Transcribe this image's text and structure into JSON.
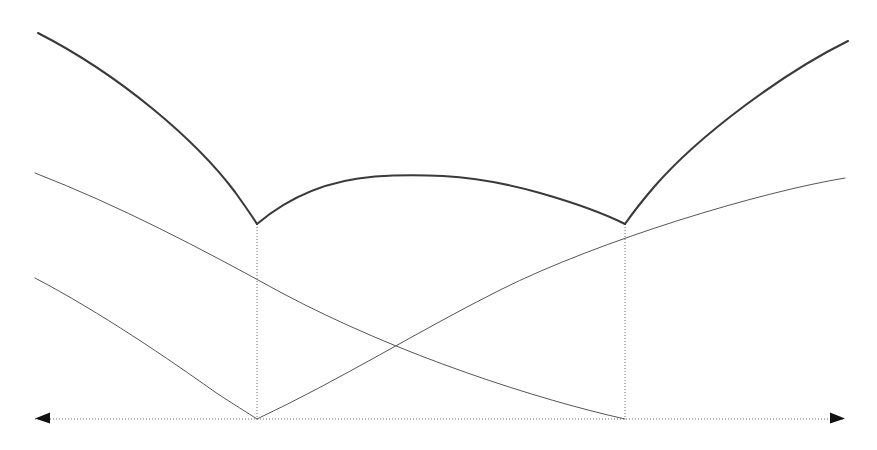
{
  "figure": {
    "type": "geometric-diagram",
    "width": 877,
    "height": 450,
    "background_color": "#ffffff"
  },
  "style": {
    "thick_stroke_color": "#3a3a3a",
    "thick_stroke_width": 2.1,
    "thin_stroke_color": "#555555",
    "thin_stroke_width": 1.0,
    "dotted_stroke_color": "#6f6f6f",
    "dotted_stroke_width": 1.0,
    "dotted_dash_pattern": "1,2",
    "arrowhead_fill": "#111111"
  },
  "geometry": {
    "baseline_y": 419,
    "baseline_x_start": 35,
    "baseline_x_end": 845,
    "cusp_left": {
      "x": 257,
      "y": 224
    },
    "cusp_right": {
      "x": 625,
      "y": 224
    },
    "foot_left": {
      "x": 257,
      "y": 419
    },
    "foot_right": {
      "x": 625,
      "y": 419
    },
    "arch_peak": {
      "x": 443,
      "y": 176
    },
    "thin_crossing": {
      "x": 440,
      "y": 300
    },
    "thick_left_end": {
      "x": 38,
      "y": 33
    },
    "thick_right_end": {
      "x": 848,
      "y": 41
    },
    "thin_upper_left_end": {
      "x": 35,
      "y": 173
    },
    "thin_upper_right_end": {
      "x": 845,
      "y": 178
    },
    "thin_lower_left_end": {
      "x": 35,
      "y": 278
    }
  },
  "paths": {
    "thick_arc_left": "M 38 33 C 120 75 196 140 235 192 C 245 206 252 216 257 224",
    "thick_arc_middle": "M 257 224 C 290 196 330 180 375 176.5 C 405 174.5 420 175 443 176 C 470 177.5 505 183 540 193 C 575 203 603 213 625 224",
    "thick_arc_right": "M 625 224 C 632 214 642 201 654 187 C 700 134 785 72 848 41",
    "thin_upper": "M 35 173 C 120 190 200 210 257 224 C 330 242 420 270 520 296 C 640 327 760 352 845 178",
    "thin_upper_real": "M 35 173 C 140 194 230 212 257 224 C 340 256 430 292 520 268 C 640 236 770 200 845 178",
    "thin_lower_left": "M 35 278 C 100 312 170 360 215 392 C 233 404 248 413 257 419",
    "thin_lower_right": "M 257 419 C 300 400 350 372 400 340 C 480 288 570 245 625 224",
    "thin_descend_right": "M 625 224 C 660 252 700 300 720 330",
    "thin_big_right": "M 257 419 C 340 380 420 330 500 290 C 600 240 760 192 845 178",
    "thin_big_left": "M 35 173 C 120 206 200 248 280 292 C 400 356 540 400 625 419",
    "dotted_vertical_left": "M 257 224 L 257 419",
    "dotted_vertical_right": "M 625 224 L 625 419",
    "dotted_baseline": "M 35 419 L 845 419"
  },
  "elements": {
    "baseline_label": "horizontal axis",
    "left_arrow_label": "left arrowhead",
    "right_arrow_label": "right arrowhead",
    "thick_curve_label": "cycloid arches",
    "thin_curve_label": "involute arcs",
    "dotted_vertical_label": "cusp drop lines"
  }
}
